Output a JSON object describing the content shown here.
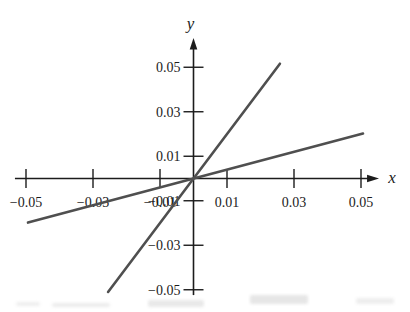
{
  "figure": {
    "background": "#ffffff",
    "axis_color": "#1c1c1c",
    "plot_line_color": "#4f4f4f"
  },
  "chart_data": {
    "type": "line",
    "title": "",
    "xlabel": "x",
    "ylabel": "y",
    "xlim": [
      -0.0533,
      0.0521
    ],
    "ylim": [
      -0.0524,
      0.0587
    ],
    "x_ticks": [
      -0.05,
      -0.03,
      -0.01,
      0.01,
      0.03,
      0.05
    ],
    "x_tick_labels": [
      "−0.05",
      "−0.03",
      "−0.01",
      "0.01",
      "0.03",
      "0.05"
    ],
    "y_ticks": [
      -0.05,
      -0.03,
      -0.01,
      0.01,
      0.03,
      0.05
    ],
    "y_tick_labels": [
      "−0.05",
      "−0.03",
      "−0.01",
      "0.01",
      "0.03",
      "0.05"
    ],
    "grid": false,
    "legend": false,
    "series": [
      {
        "name": "steep-line",
        "slope": 2,
        "points": [
          [
            -0.0255,
            -0.051
          ],
          [
            0.0258,
            0.0516
          ]
        ]
      },
      {
        "name": "shallow-line",
        "slope": 0.4,
        "points": [
          [
            -0.0494,
            -0.0198
          ],
          [
            0.0506,
            0.0202
          ]
        ]
      }
    ]
  }
}
